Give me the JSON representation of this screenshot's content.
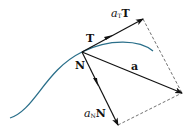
{
  "diagram": {
    "labels": {
      "T": "T",
      "N": "N",
      "a": "a",
      "aT_coef": "a",
      "aT_sub": "T",
      "aT_vec": "T",
      "aN_coef": "a",
      "aN_sub": "N",
      "aN_vec": "N"
    },
    "colors": {
      "curve": "#2a6f8a",
      "arrows": "#111111",
      "dashed": "#333333"
    }
  }
}
